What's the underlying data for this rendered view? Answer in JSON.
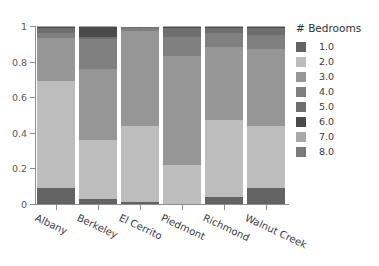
{
  "clipped_header": "",
  "chart_data": {
    "type": "bar",
    "variant": "stacked-100",
    "title": "",
    "xlabel": "",
    "ylabel": "",
    "ylim": [
      0,
      1
    ],
    "ytick_labels": [
      "0",
      "0.2",
      "0.4",
      "0.6",
      "0.8",
      "1"
    ],
    "ytick_values": [
      0,
      0.2,
      0.4,
      0.6,
      0.8,
      1
    ],
    "grid": false,
    "legend_position": "right",
    "legend_title": "# Bedrooms",
    "categories": [
      "Albany",
      "Berkeley",
      "El Cerrito",
      "Piedmont",
      "Richmond",
      "Walnut Creek"
    ],
    "series": [
      {
        "name": "1.0",
        "color": "#636363",
        "values": [
          0.09,
          0.03,
          0.01,
          0.0,
          0.04,
          0.09
        ]
      },
      {
        "name": "2.0",
        "color": "#bdbdbd",
        "values": [
          0.6,
          0.33,
          0.43,
          0.22,
          0.43,
          0.35
        ]
      },
      {
        "name": "3.0",
        "color": "#969696",
        "values": [
          0.24,
          0.4,
          0.53,
          0.61,
          0.41,
          0.43
        ]
      },
      {
        "name": "4.0",
        "color": "#808080",
        "values": [
          0.03,
          0.17,
          0.02,
          0.11,
          0.08,
          0.08
        ]
      },
      {
        "name": "5.0",
        "color": "#6e6e6e",
        "values": [
          0.03,
          0.01,
          0.005,
          0.05,
          0.03,
          0.04
        ]
      },
      {
        "name": "6.0",
        "color": "#4a4a4a",
        "values": [
          0.005,
          0.055,
          0.0,
          0.005,
          0.005,
          0.005
        ]
      },
      {
        "name": "7.0",
        "color": "#a8a8a8",
        "values": [
          0.003,
          0.003,
          0.0,
          0.003,
          0.003,
          0.003
        ]
      },
      {
        "name": "8.0",
        "color": "#7a7a7a",
        "values": [
          0.002,
          0.002,
          0.0,
          0.002,
          0.002,
          0.002
        ]
      }
    ]
  }
}
